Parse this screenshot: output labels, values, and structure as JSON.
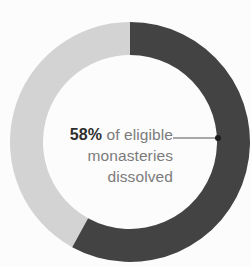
{
  "chart_data": {
    "type": "pie",
    "variant": "donut",
    "title": "",
    "subtitle": "",
    "xlabel": "",
    "ylabel": "",
    "legend_position": "none",
    "grid": false,
    "units": "percent",
    "total": 100,
    "categories": [
      "Eligible monasteries dissolved",
      "Eligible monasteries not dissolved"
    ],
    "values": [
      58,
      42
    ],
    "slices": [
      {
        "name": "Eligible monasteries dissolved",
        "value": 58,
        "display_value": "58%",
        "color": "#434343",
        "start_angle_deg": 0,
        "end_angle_deg": 208.8,
        "callout": true
      },
      {
        "name": "Eligible monasteries not dissolved",
        "value": 42,
        "display_value": "42%",
        "color": "#d3d3d3",
        "start_angle_deg": 208.8,
        "end_angle_deg": 360,
        "callout": false
      }
    ],
    "annotations": [
      {
        "name": "center-callout",
        "lines": [
          "58% of eligible",
          "monasteries",
          "dissolved"
        ],
        "emphasis": "58%",
        "leader_line": true
      }
    ]
  },
  "callout": {
    "percent": "58%",
    "line1_rest": " of eligible",
    "line2": "monasteries",
    "line3": "dissolved"
  },
  "colors": {
    "dark_segment": "#434343",
    "light_segment": "#d3d3d3",
    "background": "#fcfcfc",
    "text_muted": "#7b7b7b",
    "text_strong": "#2e2e2e",
    "leader_line": "#555555"
  },
  "geometry": {
    "center_x": 130,
    "center_y": 142,
    "outer_radius": 120,
    "inner_radius": 87,
    "leader_x1": 173,
    "leader_x2": 218,
    "leader_y": 138,
    "dot_x": 218,
    "dot_y": 138,
    "dot_radius": 3
  }
}
